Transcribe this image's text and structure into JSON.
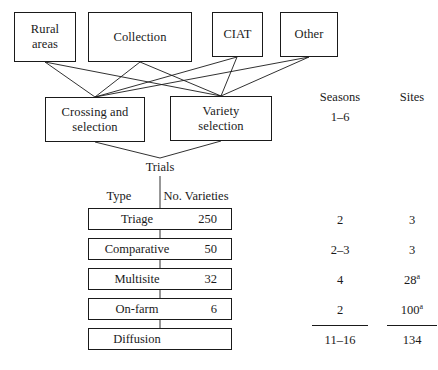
{
  "diagram": {
    "colors": {
      "line": "#1a1a1a",
      "background": "#ffffff",
      "text": "#1a1a1a"
    },
    "sources": [
      {
        "id": "rural",
        "label": "Rural\nareas"
      },
      {
        "id": "collection",
        "label": "Collection"
      },
      {
        "id": "ciat",
        "label": "CIAT"
      },
      {
        "id": "other",
        "label": "Other"
      }
    ],
    "processes": [
      {
        "id": "crossing",
        "label": "Crossing and\nselection"
      },
      {
        "id": "variety",
        "label": "Variety\nselection"
      }
    ],
    "trials_label": "Trials",
    "columns": {
      "seasons_header": "Seasons",
      "sites_header": "Sites",
      "seasons_top_value": "1–6"
    },
    "table_headers": {
      "type": "Type",
      "varieties": "No. Varieties"
    },
    "stages": [
      {
        "type": "Triage",
        "varieties": "250",
        "seasons": "2",
        "sites": "3",
        "sites_note": ""
      },
      {
        "type": "Comparative",
        "varieties": "50",
        "seasons": "2–3",
        "sites": "3",
        "sites_note": ""
      },
      {
        "type": "Multisite",
        "varieties": "32",
        "seasons": "4",
        "sites": "28",
        "sites_note": "a"
      },
      {
        "type": "On-farm",
        "varieties": "6",
        "seasons": "2",
        "sites": "100",
        "sites_note": "a"
      },
      {
        "type": "Diffusion",
        "varieties": "",
        "seasons": "",
        "sites": "",
        "sites_note": ""
      }
    ],
    "totals": {
      "seasons": "11–16",
      "sites": "134"
    }
  }
}
